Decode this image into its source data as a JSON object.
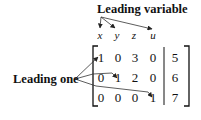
{
  "labels": {
    "leading_variable": "Leading variable",
    "leading_one": "Leading one"
  },
  "variables": [
    "x",
    "y",
    "z",
    "u"
  ],
  "matrix": {
    "rows": [
      {
        "coefficients": [
          "1",
          "0",
          "3",
          "0"
        ],
        "constant": "5"
      },
      {
        "coefficients": [
          "0",
          "1",
          "2",
          "0"
        ],
        "constant": "6"
      },
      {
        "coefficients": [
          "0",
          "0",
          "0",
          "1"
        ],
        "constant": "7"
      }
    ],
    "augmented": true
  },
  "annotations": [
    {
      "label": "Leading variable",
      "points_to": [
        "x",
        "y",
        "u"
      ]
    },
    {
      "label": "Leading one",
      "points_to": [
        "row1-col1",
        "row2-col2",
        "row3-col4"
      ]
    }
  ],
  "colors": {
    "ink": "#111111",
    "background": "#ffffff"
  }
}
